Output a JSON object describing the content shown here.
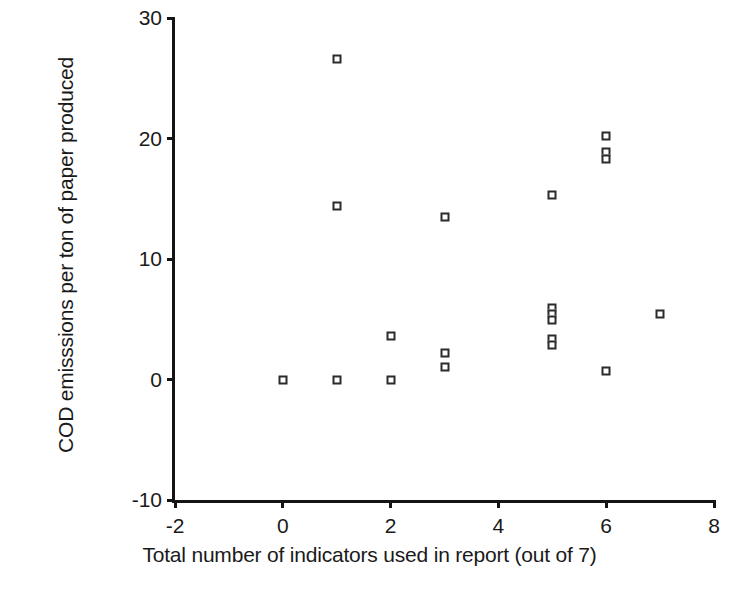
{
  "chart_data": {
    "type": "scatter",
    "title": "",
    "xlabel": "Total number of indicators used in report (out of 7)",
    "ylabel": "COD emisssions per ton of paper produced",
    "xlim": [
      -2,
      8
    ],
    "ylim": [
      -10,
      30
    ],
    "xticks": [
      -2,
      0,
      2,
      4,
      6,
      8
    ],
    "yticks": [
      -10,
      0,
      10,
      20,
      30
    ],
    "xtick_labels": [
      "-2",
      "0",
      "2",
      "4",
      "6",
      "8"
    ],
    "ytick_labels": [
      "-10",
      "0",
      "10",
      "20",
      "30"
    ],
    "grid": false,
    "legend": null,
    "marker": "open-square",
    "marker_color": "#2b2b2b",
    "marker_fill": "#ffffff",
    "axis_color": "#141414",
    "background": "#ffffff",
    "series": [
      {
        "name": "COD emissions",
        "points": [
          {
            "x": 0,
            "y": 0.0
          },
          {
            "x": 1,
            "y": 26.6
          },
          {
            "x": 1,
            "y": 14.4
          },
          {
            "x": 1,
            "y": 0.0
          },
          {
            "x": 2,
            "y": 3.6
          },
          {
            "x": 2,
            "y": 0.0
          },
          {
            "x": 3,
            "y": 13.5
          },
          {
            "x": 3,
            "y": 2.2
          },
          {
            "x": 3,
            "y": 1.0
          },
          {
            "x": 5,
            "y": 15.3
          },
          {
            "x": 5,
            "y": 5.9
          },
          {
            "x": 5,
            "y": 5.4
          },
          {
            "x": 5,
            "y": 4.9
          },
          {
            "x": 5,
            "y": 3.4
          },
          {
            "x": 5,
            "y": 2.9
          },
          {
            "x": 6,
            "y": 20.2
          },
          {
            "x": 6,
            "y": 18.9
          },
          {
            "x": 6,
            "y": 18.3
          },
          {
            "x": 6,
            "y": 0.7
          },
          {
            "x": 7,
            "y": 5.4
          }
        ]
      }
    ]
  }
}
